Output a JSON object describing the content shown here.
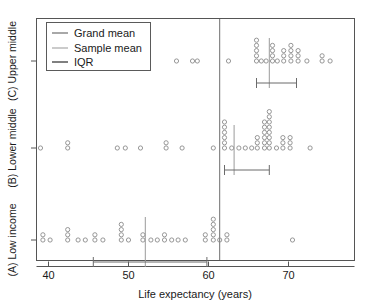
{
  "chart_data": {
    "type": "scatter",
    "title": "",
    "xlabel": "Life expectancy (years)",
    "ylabel": "",
    "xlim": [
      38.4,
      76.4
    ],
    "xticks": [
      40,
      50,
      60,
      70
    ],
    "xtick_labels": [
      "40",
      "50",
      "60",
      "70"
    ],
    "grid": false,
    "legend_position": "top-left",
    "legend": [
      {
        "label": "Grand mean",
        "color": "#6e6e6e",
        "marker": "line"
      },
      {
        "label": "Sample mean",
        "color": "#a8a8a8",
        "marker": "line"
      },
      {
        "label": "IQR",
        "color": "#4a4a4a",
        "marker": "line"
      }
    ],
    "grand_mean": 61.4,
    "groups": [
      {
        "key": "upper_middle",
        "label": "(C) Upper middle",
        "sample_mean": 67.6,
        "iqr": [
          66.0,
          71.0
        ],
        "values": [
          46.1,
          51.0,
          56.0,
          58.0,
          58.6,
          62.5,
          66.0,
          66.0,
          66.0,
          66.0,
          66.0,
          66.6,
          67.2,
          68.0,
          68.0,
          68.0,
          68.0,
          68.6,
          69.4,
          69.4,
          69.4,
          70.3,
          70.3,
          70.3,
          70.3,
          71.2,
          71.2,
          71.2,
          72.3,
          74.2,
          74.2,
          75.2
        ]
      },
      {
        "key": "lower_middle",
        "label": "(B) Lower middle",
        "sample_mean": 63.2,
        "iqr": [
          62.0,
          67.6
        ],
        "values": [
          39.0,
          42.4,
          42.4,
          48.6,
          49.6,
          51.5,
          54.7,
          54.7,
          56.7,
          60.6,
          62.0,
          62.0,
          62.0,
          62.0,
          62.0,
          62.0,
          62.9,
          63.8,
          64.6,
          65.4,
          66.1,
          66.1,
          66.1,
          67.0,
          67.0,
          67.0,
          67.0,
          67.0,
          67.0,
          67.6,
          67.6,
          67.6,
          67.6,
          67.6,
          67.6,
          67.6,
          67.6,
          68.5,
          69.3,
          69.3,
          69.3,
          70.2,
          70.2,
          70.2,
          72.7
        ]
      },
      {
        "key": "low_income",
        "label": "(A) Low income",
        "sample_mean": 52.1,
        "iqr": [
          45.6,
          59.8
        ],
        "values": [
          39.3,
          39.3,
          40.2,
          42.4,
          42.4,
          42.4,
          43.7,
          44.6,
          45.8,
          45.8,
          46.8,
          49.1,
          49.1,
          49.1,
          49.1,
          50.0,
          51.8,
          51.8,
          52.8,
          53.6,
          54.5,
          54.5,
          55.4,
          56.2,
          57.1,
          59.6,
          59.6,
          60.6,
          60.6,
          60.6,
          60.6,
          60.6,
          61.4,
          62.3,
          62.3,
          70.5
        ]
      }
    ]
  },
  "axis": {
    "x_title": "Life expectancy (years)"
  }
}
